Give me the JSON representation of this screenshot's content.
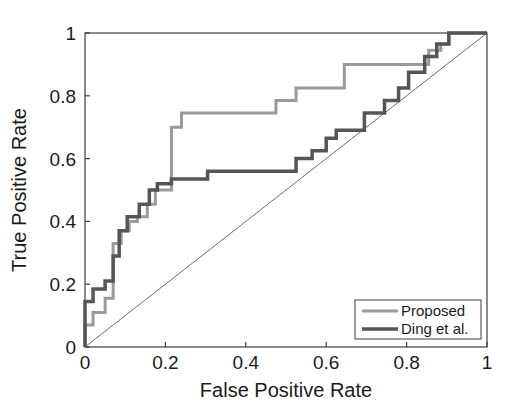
{
  "chart_data": {
    "type": "line",
    "title": "",
    "subtitle": "",
    "xlabel": "False Positive Rate",
    "ylabel": "True Positive Rate",
    "xlim": [
      0,
      1
    ],
    "ylim": [
      0,
      1
    ],
    "xticks": [
      "0",
      "0.2",
      "0.4",
      "0.6",
      "0.8",
      "1"
    ],
    "xtick_values": [
      0,
      0.2,
      0.4,
      0.6,
      0.8,
      1
    ],
    "yticks": [
      "0",
      "0.2",
      "0.4",
      "0.6",
      "0.8",
      "1"
    ],
    "ytick_values": [
      0,
      0.2,
      0.4,
      0.6,
      0.8,
      1
    ],
    "grid": false,
    "legend_position": "lower-right",
    "drawstyle": "steps-post",
    "series": [
      {
        "name": "Proposed",
        "color": "#9a9a9a",
        "linewidth": 3,
        "x": [
          0.0,
          0.0,
          0.02,
          0.02,
          0.05,
          0.05,
          0.07,
          0.07,
          0.09,
          0.09,
          0.11,
          0.11,
          0.13,
          0.13,
          0.155,
          0.155,
          0.175,
          0.175,
          0.215,
          0.215,
          0.215,
          0.24,
          0.24,
          0.305,
          0.305,
          0.475,
          0.475,
          0.525,
          0.525,
          0.645,
          0.645,
          0.855,
          0.855,
          0.885,
          0.885,
          0.905,
          0.905,
          1.0
        ],
        "y": [
          0.0,
          0.07,
          0.07,
          0.11,
          0.11,
          0.155,
          0.155,
          0.33,
          0.33,
          0.37,
          0.37,
          0.4,
          0.4,
          0.415,
          0.415,
          0.455,
          0.455,
          0.5,
          0.5,
          0.66,
          0.7,
          0.7,
          0.745,
          0.745,
          0.745,
          0.745,
          0.785,
          0.785,
          0.825,
          0.825,
          0.9,
          0.9,
          0.945,
          0.945,
          0.965,
          0.965,
          1.0,
          1.0
        ]
      },
      {
        "name": "Ding et al.",
        "color": "#555555",
        "linewidth": 3.5,
        "x": [
          0.0,
          0.0,
          0.02,
          0.02,
          0.05,
          0.05,
          0.07,
          0.07,
          0.085,
          0.085,
          0.105,
          0.105,
          0.135,
          0.135,
          0.16,
          0.16,
          0.18,
          0.18,
          0.215,
          0.215,
          0.305,
          0.305,
          0.525,
          0.525,
          0.565,
          0.565,
          0.6,
          0.6,
          0.625,
          0.625,
          0.665,
          0.665,
          0.695,
          0.695,
          0.745,
          0.745,
          0.78,
          0.78,
          0.805,
          0.805,
          0.845,
          0.845,
          0.875,
          0.875,
          0.905,
          0.905,
          1.0
        ],
        "y": [
          0.0,
          0.145,
          0.145,
          0.185,
          0.185,
          0.21,
          0.21,
          0.29,
          0.29,
          0.37,
          0.37,
          0.415,
          0.415,
          0.455,
          0.455,
          0.5,
          0.5,
          0.52,
          0.52,
          0.535,
          0.535,
          0.56,
          0.56,
          0.6,
          0.6,
          0.625,
          0.625,
          0.665,
          0.665,
          0.69,
          0.69,
          0.69,
          0.69,
          0.745,
          0.745,
          0.785,
          0.785,
          0.825,
          0.825,
          0.875,
          0.875,
          0.925,
          0.925,
          0.965,
          0.965,
          1.0,
          1.0
        ]
      }
    ],
    "reference_line": {
      "name": "chance-diagonal",
      "color": "#6e6e6e",
      "linewidth": 1,
      "x": [
        0,
        1
      ],
      "y": [
        0,
        1
      ]
    }
  },
  "legend": {
    "entries": [
      {
        "label": "Proposed",
        "color": "#9a9a9a"
      },
      {
        "label": "Ding et al.",
        "color": "#555555"
      }
    ]
  },
  "axis": {
    "x_title": "False Positive Rate",
    "y_title": "True Positive Rate"
  }
}
